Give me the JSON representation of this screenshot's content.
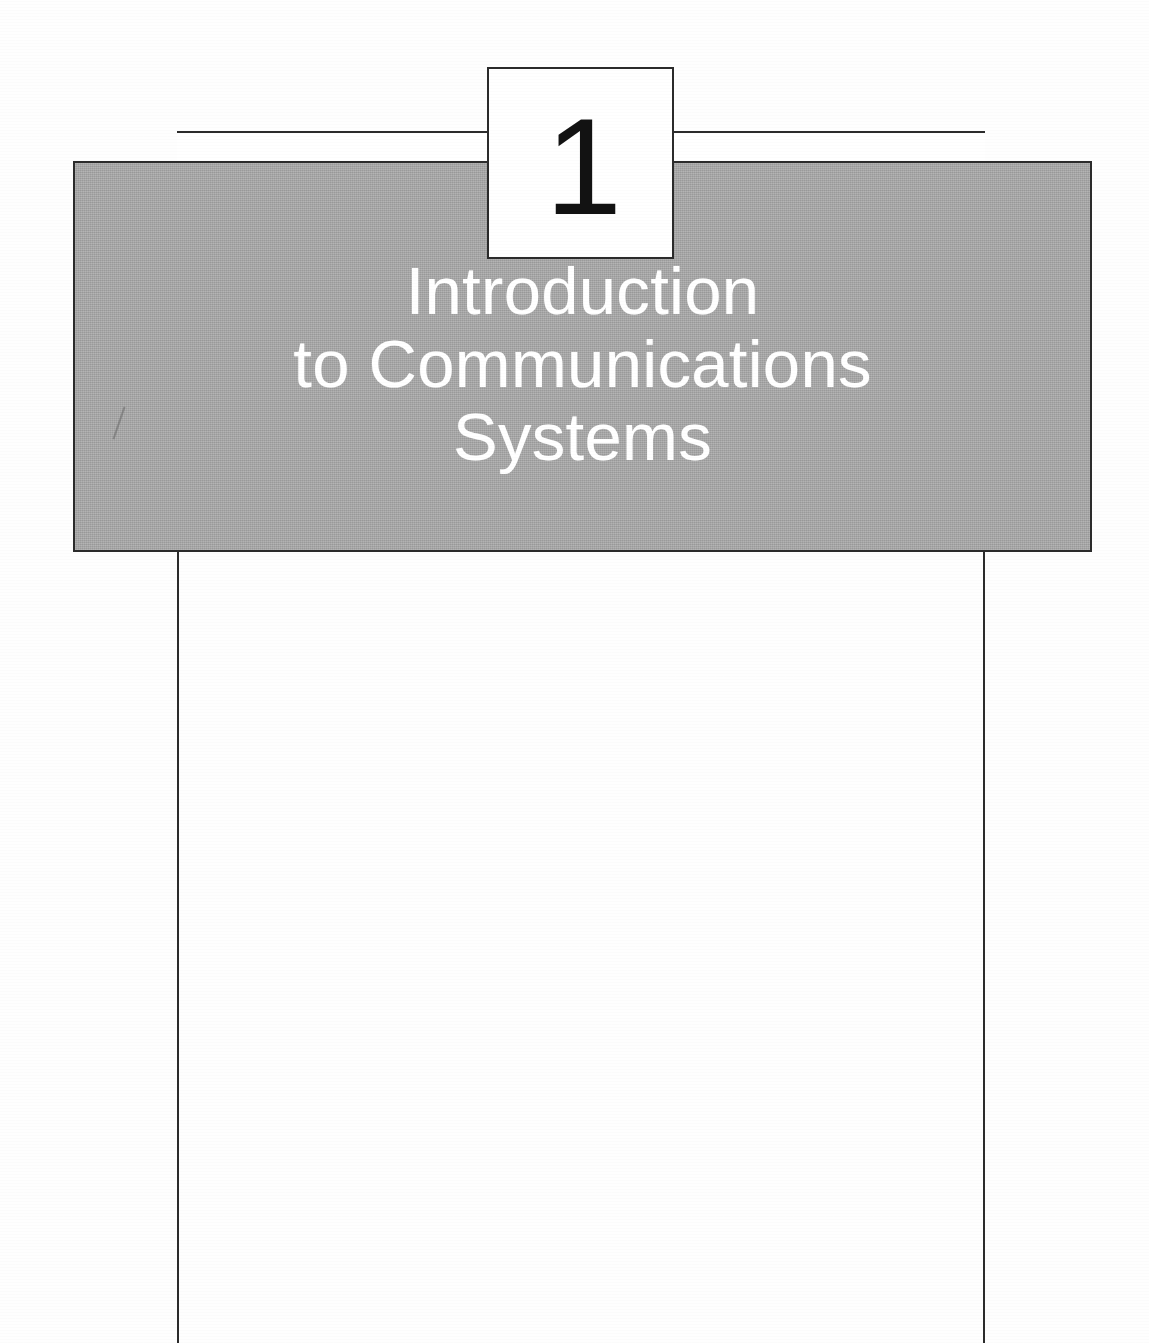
{
  "page": {
    "kind": "book-chapter-opening-page",
    "background_color": "#ffffff",
    "width": 1149,
    "height": 1343
  },
  "chapter": {
    "number": "1",
    "number_box": {
      "border_color": "#2b2b2b",
      "fill_color": "#ffffff"
    },
    "title_panel": {
      "fill_color": "#a9a9a9",
      "border_color": "#2b2b2b",
      "text_color": "#ffffff"
    },
    "title_lines": [
      "Introduction",
      "to Communications",
      "Systems"
    ],
    "title_full": "Introduction to Communications Systems"
  },
  "rules": {
    "left_rule_color": "#2b2b2b",
    "right_rule_color": "#2b2b2b",
    "head_band_fill": "#ffffff"
  }
}
